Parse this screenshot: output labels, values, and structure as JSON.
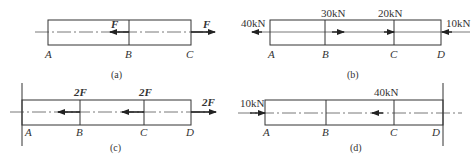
{
  "figure": {
    "panels": [
      {
        "id": "a",
        "caption": "(a)",
        "points": [
          "A",
          "B",
          "C"
        ],
        "supports": [],
        "forces": [
          {
            "at": "B",
            "label": "F",
            "direction": "left"
          },
          {
            "at": "C",
            "label": "F",
            "direction": "right"
          }
        ]
      },
      {
        "id": "b",
        "caption": "(b)",
        "points": [
          "A",
          "B",
          "C",
          "D"
        ],
        "supports": [],
        "forces": [
          {
            "at": "A",
            "label": "40kN",
            "direction": "left"
          },
          {
            "at": "B",
            "label": "30kN",
            "direction": "right"
          },
          {
            "at": "C",
            "label": "20kN",
            "direction": "right"
          },
          {
            "at": "D",
            "label": "10kN",
            "direction": "left"
          }
        ]
      },
      {
        "id": "c",
        "caption": "(c)",
        "points": [
          "A",
          "B",
          "C",
          "D"
        ],
        "supports": [
          "fixed wall at A"
        ],
        "forces": [
          {
            "at": "B",
            "label": "2F",
            "direction": "left"
          },
          {
            "at": "C",
            "label": "2F",
            "direction": "left"
          },
          {
            "at": "D",
            "label": "2F",
            "direction": "right"
          }
        ]
      },
      {
        "id": "d",
        "caption": "(d)",
        "points": [
          "A",
          "B",
          "C",
          "D"
        ],
        "supports": [
          "fixed wall at D"
        ],
        "forces": [
          {
            "at": "A",
            "label": "10kN",
            "direction": "right"
          },
          {
            "at": "C",
            "label": "40kN",
            "direction": "left"
          }
        ]
      }
    ],
    "colors": {
      "line": "#333333",
      "background": "#ffffff"
    }
  }
}
